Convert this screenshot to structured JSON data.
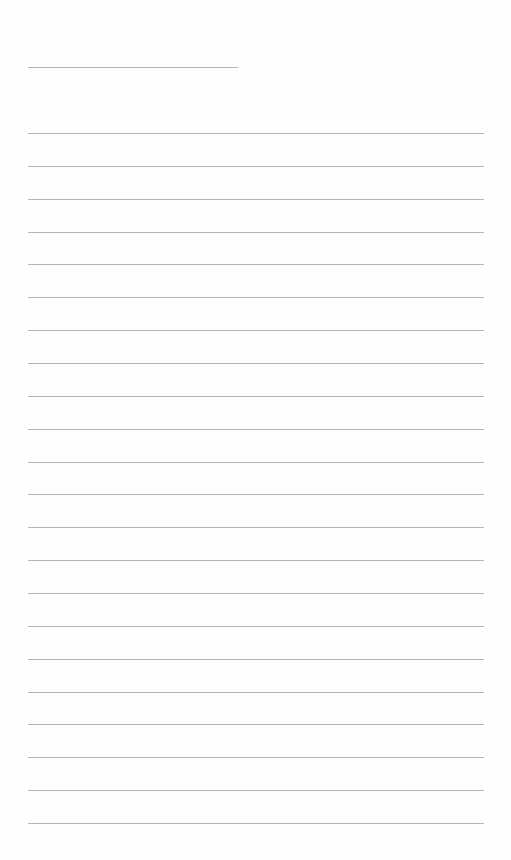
{
  "page": {
    "type": "blank-lined-sheet",
    "title_line": {
      "text": ""
    },
    "line_count": 22,
    "lines": [
      "",
      "",
      "",
      "",
      "",
      "",
      "",
      "",
      "",
      "",
      "",
      "",
      "",
      "",
      "",
      "",
      "",
      "",
      "",
      "",
      "",
      ""
    ],
    "colors": {
      "background": "#fefefe",
      "rule": "#b4b4b4"
    }
  }
}
